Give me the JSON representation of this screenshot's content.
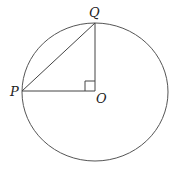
{
  "diagram": {
    "type": "geometry",
    "labels": {
      "P": "P",
      "Q": "Q",
      "O": "O"
    },
    "colors": {
      "stroke": "#555555",
      "text": "#222222",
      "background": "#ffffff"
    }
  }
}
